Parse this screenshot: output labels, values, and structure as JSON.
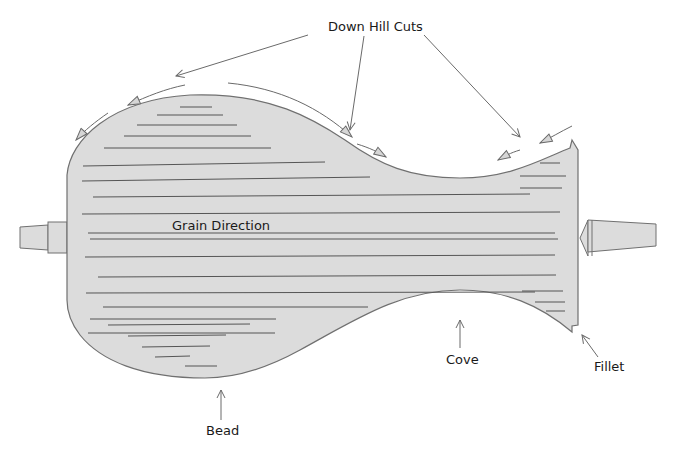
{
  "diagram": {
    "colors": {
      "wood_fill": "#dcdcdc",
      "outline": "#707070",
      "grain_line": "#555555",
      "arrow": "#6a6a6a",
      "text": "#1a1a1a",
      "background": "#ffffff"
    },
    "labels": {
      "down_hill_cuts": "Down Hill Cuts",
      "grain_direction": "Grain Direction",
      "bead": "Bead",
      "cove": "Cove",
      "fillet": "Fillet"
    },
    "parts": [
      {
        "name": "headstock-drive-center",
        "side": "left"
      },
      {
        "name": "workpiece",
        "features": [
          "Bead",
          "Cove",
          "Fillet"
        ]
      },
      {
        "name": "tailstock-live-center",
        "side": "right"
      }
    ],
    "cut_arrows_count": 7
  }
}
